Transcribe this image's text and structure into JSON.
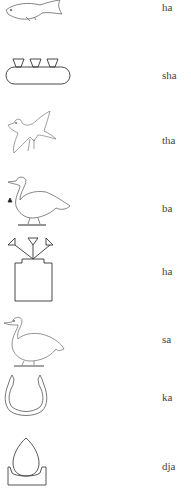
{
  "rows": [
    {
      "glyph": "fish-glyph",
      "label": "ha"
    },
    {
      "glyph": "basket-with-three-cups-glyph",
      "label": "sha"
    },
    {
      "glyph": "flying-bird-glyph",
      "label": "tha"
    },
    {
      "glyph": "goose-glyph",
      "label": "ba"
    },
    {
      "glyph": "tree-on-enclosure-glyph",
      "label": "ha"
    },
    {
      "glyph": "duck-glyph",
      "label": "sa"
    },
    {
      "glyph": "raised-arms-glyph",
      "label": "ka"
    },
    {
      "glyph": "drop-on-stand-glyph",
      "label": "dja"
    }
  ]
}
